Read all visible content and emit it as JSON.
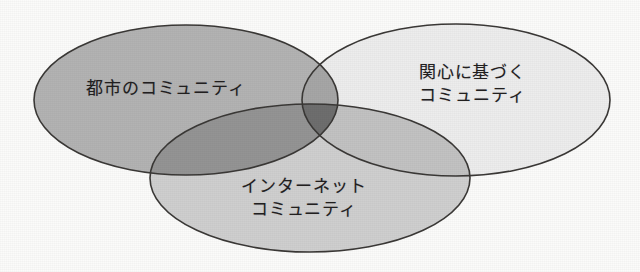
{
  "diagram": {
    "type": "venn",
    "background_color": "#fbfbfa",
    "stroke_color": "#3a3836",
    "sets": [
      {
        "id": "urban",
        "label_lines": [
          "都市のコミュニティ"
        ],
        "label_text": "都市のコミュニティ",
        "fill_color": "#b3b3b3",
        "position": "left"
      },
      {
        "id": "interest",
        "label_lines": [
          "関心に基づく",
          "コミュニティ"
        ],
        "label_text": "関心に基づくコミュニティ",
        "fill_color": "#ededed",
        "position": "right"
      },
      {
        "id": "internet",
        "label_lines": [
          "インターネット",
          "コミュニティ"
        ],
        "label_text": "インターネットコミュニティ",
        "fill_color": "#cfcfcf",
        "position": "bottom"
      }
    ],
    "intersections": [
      {
        "id": "urban-interest",
        "sets": [
          "urban",
          "interest"
        ],
        "fill_color": "#a6a6a6"
      },
      {
        "id": "urban-internet",
        "sets": [
          "urban",
          "internet"
        ],
        "fill_color": "#949494"
      },
      {
        "id": "interest-internet",
        "sets": [
          "interest",
          "internet"
        ],
        "fill_color": "#c2c2c2"
      },
      {
        "id": "urban-interest-internet",
        "sets": [
          "urban",
          "interest",
          "internet"
        ],
        "fill_color": "#6e6e6e"
      }
    ]
  }
}
